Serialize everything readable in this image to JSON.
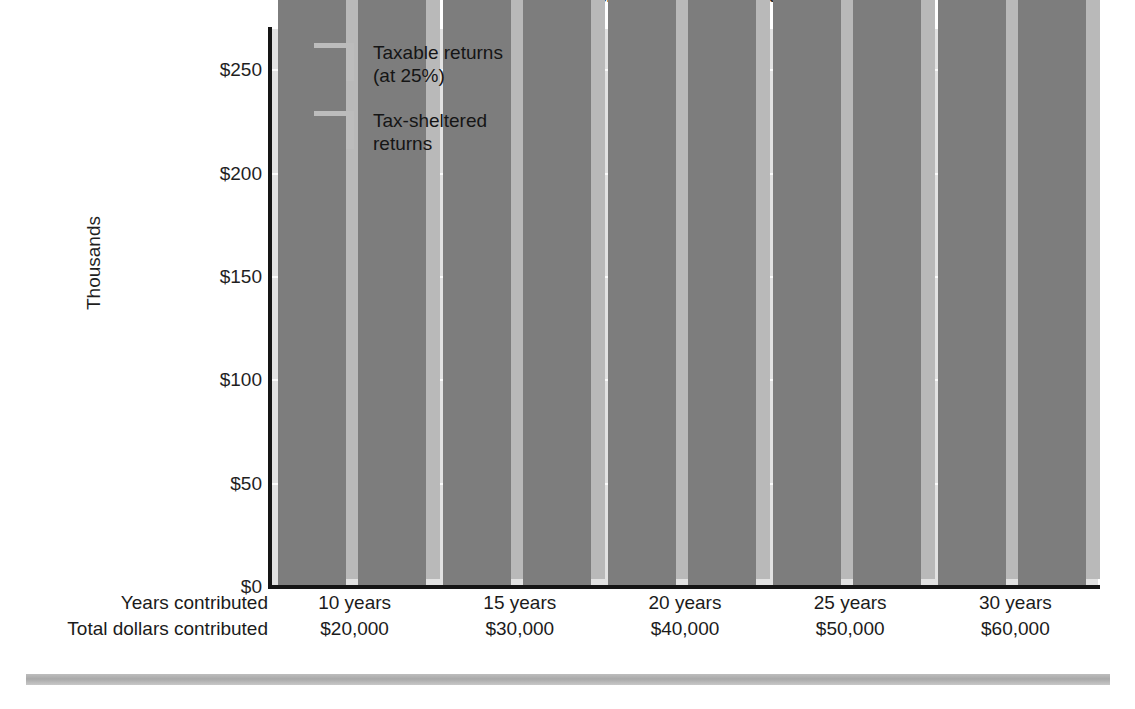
{
  "chart_data": {
    "type": "bar",
    "title": "Tax-sheltered vs. taxable returns",
    "xlabel": "",
    "ylabel": "Thousands",
    "ylim": [
      0,
      270
    ],
    "yticks": [
      0,
      50,
      100,
      150,
      200,
      250
    ],
    "ytick_labels": [
      "$0",
      "$50",
      "$100",
      "$150",
      "$200",
      "$250"
    ],
    "grid": "horizontal-white",
    "legend_position": "upper-left-inside",
    "categories": [
      "10 years",
      "15 years",
      "20 years",
      "25 years",
      "30 years"
    ],
    "category_sublabels": [
      "$20,000",
      "$30,000",
      "$40,000",
      "$50,000",
      "$60,000"
    ],
    "row_labels": {
      "years": "Years contributed",
      "dollars": "Total dollars contributed"
    },
    "series": [
      {
        "name": "Taxable returns (at 25%)",
        "legend_label": "Taxable returns\n(at 25%)",
        "color": "#7d7d7d",
        "values": [
          27943,
          49345,
          77985,
          116313,
          167603
        ],
        "value_labels": [
          "$27,943",
          "$49,345",
          "$77,985",
          "$116,313",
          "$167,603"
        ]
      },
      {
        "name": "Tax-sheltered returns",
        "legend_label": "Tax-sheltered\nreturns",
        "color": "#7d7d7d",
        "values": [
          31920,
          58648,
          98846,
          157909,
          244691
        ],
        "value_labels": [
          "$31,920",
          "$58,648",
          "$98,846",
          "$157,909",
          "$244,691"
        ]
      }
    ]
  },
  "colors": {
    "plot_background": "#e2e2e2",
    "gridline": "#fbfbfb",
    "bar_face": "#7d7d7d",
    "bar_side": "#b9b9b9",
    "axis": "#151515",
    "text": "#1b1b1b",
    "bottom_rule": "#b4b4b4"
  }
}
